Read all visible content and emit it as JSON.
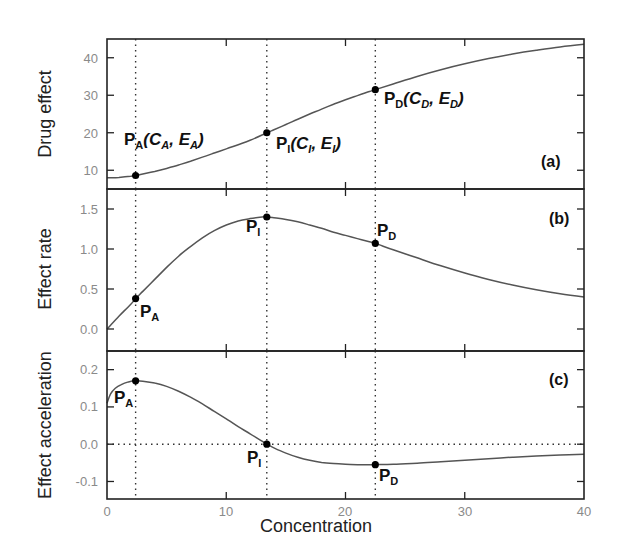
{
  "chart_data": [
    {
      "type": "line",
      "panel": "(a)",
      "ylabel": "Drug effect",
      "xlabel": "",
      "xlim": [
        0,
        40
      ],
      "ylim": [
        5,
        45
      ],
      "yticks": [
        10,
        20,
        30,
        40
      ],
      "xticks": [
        0,
        10,
        20,
        30,
        40
      ],
      "grid": false,
      "series": [
        {
          "name": "Drug effect",
          "x": [
            0,
            1,
            2,
            2.4,
            3,
            4,
            5,
            6,
            7,
            8,
            9,
            10,
            11,
            12,
            13,
            13.4,
            14,
            15,
            16,
            17,
            18,
            19,
            20,
            21,
            22,
            22.5,
            24,
            26,
            28,
            30,
            32,
            34,
            36,
            38,
            40
          ],
          "values": [
            8.0,
            8.1,
            8.4,
            8.6,
            9.0,
            9.7,
            10.5,
            11.4,
            12.4,
            13.5,
            14.6,
            15.7,
            16.8,
            18.0,
            19.4,
            20.0,
            20.8,
            22.2,
            23.6,
            25.0,
            26.3,
            27.6,
            28.8,
            29.9,
            31.0,
            31.5,
            33.0,
            35.0,
            36.8,
            38.4,
            39.8,
            41.0,
            42.0,
            42.9,
            43.6
          ]
        }
      ],
      "vlines": [
        2.4,
        13.4,
        22.5
      ],
      "annotations": [
        {
          "text": "P_A(C_A, E_A)",
          "x": 2.4,
          "y": 8.6
        },
        {
          "text": "P_I(C_I, E_I)",
          "x": 13.4,
          "y": 20.0
        },
        {
          "text": "P_D(C_D, E_D)",
          "x": 22.5,
          "y": 31.5
        }
      ]
    },
    {
      "type": "line",
      "panel": "(b)",
      "ylabel": "Effect rate",
      "xlabel": "",
      "xlim": [
        0,
        40
      ],
      "ylim": [
        -0.275,
        1.75
      ],
      "yticks": [
        0.0,
        0.5,
        1.0,
        1.5
      ],
      "xticks": [
        0,
        10,
        20,
        30,
        40
      ],
      "grid": false,
      "series": [
        {
          "name": "Effect rate",
          "x": [
            0,
            1,
            2,
            2.4,
            3,
            4,
            5,
            6,
            7,
            8,
            9,
            10,
            11,
            12,
            13,
            13.4,
            14,
            15,
            16,
            17,
            18,
            19,
            20,
            21,
            22,
            22.5,
            24,
            26,
            28,
            30,
            32,
            34,
            36,
            38,
            40
          ],
          "values": [
            0.0,
            0.16,
            0.31,
            0.38,
            0.47,
            0.62,
            0.77,
            0.91,
            1.03,
            1.14,
            1.23,
            1.3,
            1.35,
            1.38,
            1.4,
            1.4,
            1.39,
            1.37,
            1.34,
            1.3,
            1.26,
            1.21,
            1.17,
            1.13,
            1.09,
            1.07,
            0.99,
            0.89,
            0.79,
            0.7,
            0.62,
            0.55,
            0.49,
            0.44,
            0.4
          ]
        }
      ],
      "vlines": [
        2.4,
        13.4,
        22.5
      ],
      "annotations": [
        {
          "text": "P_A",
          "x": 2.4,
          "y": 0.38
        },
        {
          "text": "P_I",
          "x": 13.4,
          "y": 1.4
        },
        {
          "text": "P_D",
          "x": 22.5,
          "y": 1.07
        }
      ]
    },
    {
      "type": "line",
      "panel": "(c)",
      "ylabel": "Effect acceleration",
      "xlabel": "Concentration",
      "xlim": [
        0,
        40
      ],
      "ylim": [
        -0.147,
        0.25
      ],
      "yticks": [
        -0.1,
        0.0,
        0.1,
        0.2
      ],
      "xticks": [
        0,
        10,
        20,
        30,
        40
      ],
      "xticklabels": [
        "0",
        "10",
        "20",
        "30",
        "40"
      ],
      "grid": false,
      "series": [
        {
          "name": "Effect acceleration",
          "x": [
            0,
            0.3,
            0.7,
            1.2,
            1.8,
            2.4,
            3,
            4,
            5,
            6,
            7,
            8,
            9,
            10,
            11,
            12,
            13,
            13.4,
            14,
            15,
            16,
            17,
            18,
            19,
            20,
            21,
            22,
            22.5,
            24,
            26,
            28,
            30,
            32,
            34,
            36,
            38,
            40
          ],
          "values": [
            0.11,
            0.135,
            0.15,
            0.16,
            0.167,
            0.17,
            0.169,
            0.164,
            0.155,
            0.142,
            0.126,
            0.108,
            0.088,
            0.068,
            0.047,
            0.028,
            0.008,
            0.0,
            -0.01,
            -0.024,
            -0.035,
            -0.043,
            -0.049,
            -0.052,
            -0.054,
            -0.055,
            -0.055,
            -0.055,
            -0.054,
            -0.051,
            -0.047,
            -0.043,
            -0.039,
            -0.035,
            -0.032,
            -0.029,
            -0.027
          ]
        }
      ],
      "hlines": [
        0.0
      ],
      "vlines": [
        2.4,
        13.4,
        22.5
      ],
      "annotations": [
        {
          "text": "P_A",
          "x": 2.4,
          "y": 0.17
        },
        {
          "text": "P_I",
          "x": 13.4,
          "y": 0.0
        },
        {
          "text": "P_D",
          "x": 22.5,
          "y": -0.055
        }
      ]
    }
  ],
  "labels": {
    "xlabel": "Concentration",
    "panel_a": {
      "ylabel": "Drug effect",
      "tag": "(a)",
      "yticks": [
        "10",
        "20",
        "30",
        "40"
      ],
      "pA": {
        "main": "P",
        "sub": "A",
        "rest_open": "(C",
        "rest_sub1": "A",
        "rest_mid": ", E",
        "rest_sub2": "A",
        "rest_close": ")"
      },
      "pI": {
        "main": "P",
        "sub": "I",
        "rest_open": "(C",
        "rest_sub1": "I",
        "rest_mid": ", E",
        "rest_sub2": "I",
        "rest_close": ")"
      },
      "pD": {
        "main": "P",
        "sub": "D",
        "rest_open": "(C",
        "rest_sub1": "D",
        "rest_mid": ", E",
        "rest_sub2": "D",
        "rest_close": ")"
      }
    },
    "panel_b": {
      "ylabel": "Effect rate",
      "tag": "(b)",
      "yticks": [
        "0.0",
        "0.5",
        "1.0",
        "1.5"
      ],
      "pA": {
        "main": "P",
        "sub": "A"
      },
      "pI": {
        "main": "P",
        "sub": "I"
      },
      "pD": {
        "main": "P",
        "sub": "D"
      }
    },
    "panel_c": {
      "ylabel": "Effect acceleration",
      "tag": "(c)",
      "yticks": [
        "-0.1",
        "0.0",
        "0.1",
        "0.2"
      ],
      "xticks": [
        "0",
        "10",
        "20",
        "30",
        "40"
      ],
      "pA": {
        "main": "P",
        "sub": "A"
      },
      "pI": {
        "main": "P",
        "sub": "I"
      },
      "pD": {
        "main": "P",
        "sub": "D"
      }
    }
  },
  "colors": {
    "curve": "#555555",
    "axis": "#222222",
    "tick_label": "#8a8a8a",
    "marker": "#000000"
  }
}
